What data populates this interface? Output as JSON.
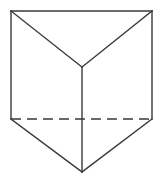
{
  "figure": {
    "shape_name": "triangular-prism",
    "canvas": {
      "width": 162,
      "height": 179,
      "background_color": "#ffffff"
    },
    "style": {
      "stroke_color": "#3a3a3a",
      "stroke_width": 1.4,
      "fill_color": "#ffffff",
      "dash_pattern": "10 6"
    },
    "vertices": {
      "top_left": {
        "label": "A",
        "x": 11,
        "y": 11
      },
      "top_right": {
        "label": "B",
        "x": 152,
        "y": 11
      },
      "top_apex": {
        "label": "C",
        "x": 82,
        "y": 67
      },
      "mid_left": {
        "label": "D",
        "x": 11,
        "y": 119
      },
      "mid_right": {
        "label": "E",
        "x": 152,
        "y": 119
      },
      "bottom_apex": {
        "label": "F",
        "x": 82,
        "y": 172
      }
    },
    "edges": [
      {
        "name": "top-edge",
        "kind": "solid",
        "from": "top_left",
        "to": "top_right",
        "points": "11,11 152,11"
      },
      {
        "name": "left-upper-diagonal",
        "kind": "solid",
        "from": "top_left",
        "to": "top_apex",
        "points": "11,11 82,67"
      },
      {
        "name": "right-upper-diagonal",
        "kind": "solid",
        "from": "top_right",
        "to": "top_apex",
        "points": "152,11 82,67"
      },
      {
        "name": "left-vertical-edge",
        "kind": "solid",
        "from": "top_left",
        "to": "mid_left",
        "points": "11,11 11,119"
      },
      {
        "name": "right-vertical-edge",
        "kind": "solid",
        "from": "top_right",
        "to": "mid_right",
        "points": "152,11 152,119"
      },
      {
        "name": "center-vertical-edge",
        "kind": "solid",
        "from": "top_apex",
        "to": "bottom_apex",
        "points": "82,67 82,172"
      },
      {
        "name": "hidden-base-edge",
        "kind": "dashed",
        "from": "mid_left",
        "to": "mid_right",
        "points": "11,119 152,119"
      },
      {
        "name": "left-lower-diagonal",
        "kind": "solid",
        "from": "mid_left",
        "to": "bottom_apex",
        "points": "11,119 82,172"
      },
      {
        "name": "right-lower-diagonal",
        "kind": "solid",
        "from": "mid_right",
        "to": "bottom_apex",
        "points": "152,119 82,172"
      }
    ]
  }
}
